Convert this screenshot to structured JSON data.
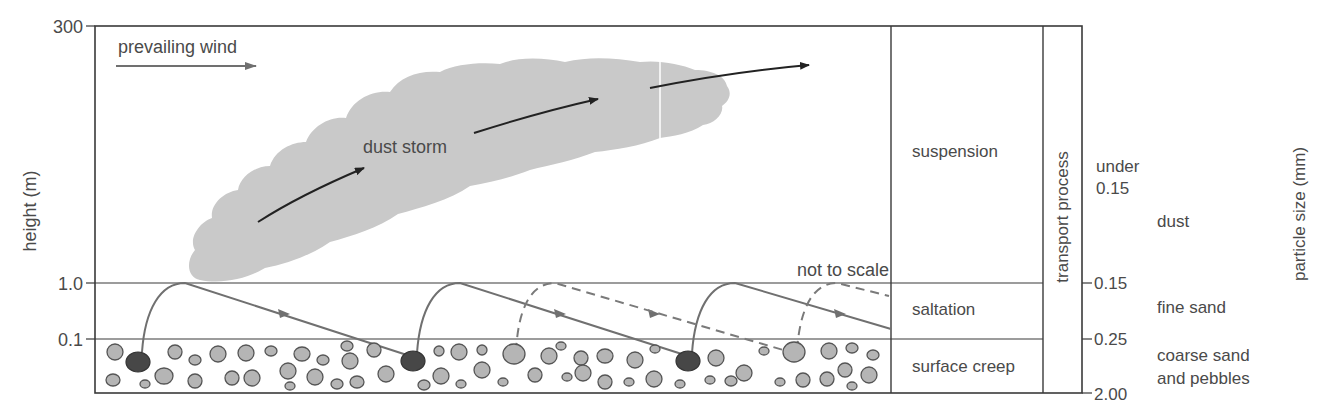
{
  "axis": {
    "label": "height (m)",
    "ticks": [
      "300",
      "1.0",
      "0.1"
    ]
  },
  "labels": {
    "prevailing_wind": "prevailing wind",
    "dust_storm": "dust storm",
    "not_to_scale": "not to scale"
  },
  "transport_column": {
    "header": "transport process",
    "rows": [
      "suspension",
      "saltation",
      "surface creep"
    ]
  },
  "particle_size": {
    "label": "particle size (mm)",
    "ticks": [
      "0.15",
      "0.25",
      "2.00"
    ],
    "under_label": "under",
    "under_value": "0.15",
    "categories": [
      "dust",
      "fine sand",
      "coarse sand",
      "and pebbles"
    ]
  },
  "colors": {
    "line": "#3a3a3a",
    "cloud": "#c8c8c8",
    "pebble_light": "#b5b5b5",
    "pebble_dark": "#474747",
    "path": "#707070"
  }
}
